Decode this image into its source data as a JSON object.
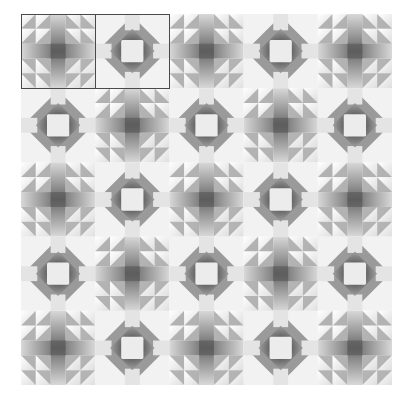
{
  "quilt": {
    "rows": 5,
    "cols": 5,
    "pattern": "checkerboard",
    "block_types": [
      "cross",
      "ring"
    ],
    "layout": [
      [
        "cross",
        "ring",
        "cross",
        "ring",
        "cross"
      ],
      [
        "ring",
        "cross",
        "ring",
        "cross",
        "ring"
      ],
      [
        "cross",
        "ring",
        "cross",
        "ring",
        "cross"
      ],
      [
        "ring",
        "cross",
        "ring",
        "cross",
        "ring"
      ],
      [
        "cross",
        "ring",
        "cross",
        "ring",
        "cross"
      ]
    ],
    "highlighted_blocks": [
      {
        "row": 0,
        "col": 0
      },
      {
        "row": 0,
        "col": 1
      }
    ],
    "colors": {
      "light": "#f2f2f2",
      "white": "#fafafa",
      "mid": "#a8a8a8",
      "dark": "#6e6e6e",
      "darker": "#555555",
      "frame": "#4a4a4a"
    }
  }
}
